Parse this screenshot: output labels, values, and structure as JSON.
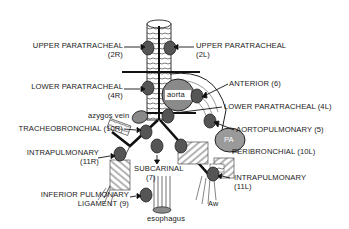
{
  "diagram": {
    "type": "anatomical lymph node station map (mediastinum)",
    "structures": {
      "aorta": "aorta",
      "pa": "PA",
      "azygos": "azygos vein",
      "esophagus": "esophagus",
      "aw": "Aw"
    },
    "stations": [
      {
        "id": "2R",
        "line1": "UPPER PARATRACHEAL",
        "line2": "(2R)",
        "side": "left"
      },
      {
        "id": "2L",
        "line1": "UPPER PARATRACHEAL",
        "line2": "(2L)",
        "side": "right"
      },
      {
        "id": "4R",
        "line1": "LOWER PARATRACHEAL",
        "line2": "(4R)",
        "side": "left"
      },
      {
        "id": "6",
        "line1": "ANTERIOR (6)",
        "side": "right"
      },
      {
        "id": "4L",
        "line1": "LOWER PARATRACHEAL (4L)",
        "side": "right"
      },
      {
        "id": "10R",
        "line1": "TRACHEOBRONCHIAL (10R)",
        "side": "left"
      },
      {
        "id": "5",
        "line1": "AORTOPULMONARY (5)",
        "side": "right"
      },
      {
        "id": "11R",
        "line1": "INTRAPULMONARY",
        "line2": "(11R)",
        "side": "left"
      },
      {
        "id": "10L",
        "line1": "PERIBRONCHIAL (10L)",
        "side": "right"
      },
      {
        "id": "7",
        "line1": "SUBCARINAL",
        "line2": "(7)",
        "side": "center"
      },
      {
        "id": "11L",
        "line1": "INTRAPULMONARY",
        "line2": "(11L)",
        "side": "right"
      },
      {
        "id": "9",
        "line1": "INFERIOR PULMONARY",
        "line2": "LIGAMENT (9)",
        "side": "left"
      }
    ],
    "colors": {
      "node_fill": "#555555",
      "aorta_fill": "#8a8a8a",
      "pa_fill": "#9a9a9a",
      "line": "#111111",
      "background": "#ffffff"
    }
  }
}
